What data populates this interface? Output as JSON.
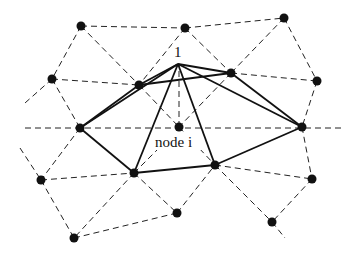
{
  "diagram": {
    "type": "triangular mesh around a node",
    "labels": {
      "apex": "1",
      "center": "node i"
    },
    "colors": {
      "line": "#111111",
      "node": "#111111",
      "background": "#ffffff"
    },
    "nodes": [
      {
        "id": "n0",
        "x": 81,
        "y": 26
      },
      {
        "id": "n1",
        "x": 185,
        "y": 28
      },
      {
        "id": "n2",
        "x": 284,
        "y": 18
      },
      {
        "id": "n3",
        "x": 52,
        "y": 79
      },
      {
        "id": "n4",
        "x": 139,
        "y": 85
      },
      {
        "id": "n5",
        "x": 231,
        "y": 73
      },
      {
        "id": "n6",
        "x": 317,
        "y": 81
      },
      {
        "id": "n7",
        "x": 80,
        "y": 128
      },
      {
        "id": "i",
        "x": 179,
        "y": 127
      },
      {
        "id": "n8",
        "x": 302,
        "y": 127
      },
      {
        "id": "n9",
        "x": 41,
        "y": 180
      },
      {
        "id": "n10",
        "x": 134,
        "y": 173
      },
      {
        "id": "n11",
        "x": 215,
        "y": 165
      },
      {
        "id": "n12",
        "x": 312,
        "y": 179
      },
      {
        "id": "n13",
        "x": 74,
        "y": 238
      },
      {
        "id": "n14",
        "x": 177,
        "y": 213
      },
      {
        "id": "n15",
        "x": 272,
        "y": 222
      }
    ],
    "apex": {
      "x": 178,
      "y": 64
    }
  }
}
